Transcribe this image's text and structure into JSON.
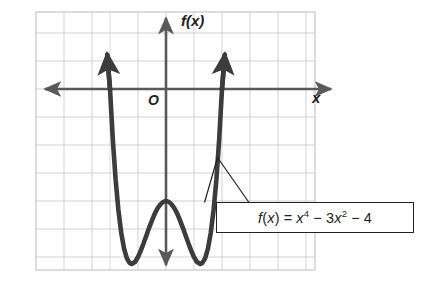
{
  "figure": {
    "axis_label_x": "x",
    "axis_label_y": "f(x)",
    "origin_label": "O",
    "equation_label": "f(x) = x4 − 3x2 − 4",
    "colors": {
      "curve": "#3c3c3c",
      "axis": "#595959",
      "grid": "#c9c9d6",
      "plot_border": "#bfbfcc",
      "text": "#231f20",
      "callout_border": "#231f20",
      "background": "#ffffff"
    }
  },
  "chart_data": {
    "type": "line",
    "title": "",
    "subtitle": "",
    "xlabel": "x",
    "ylabel": "f(x)",
    "equation": "f(x) = x^4 - 3x^2 - 4",
    "equation_display": "f(x) = x⁴ − 3x² − 4",
    "grid": true,
    "legend": "none",
    "annotations": [
      {
        "text": "f(x) = x⁴ − 3x² − 4",
        "points_to_curve": true,
        "leader_lines": 2
      }
    ],
    "origin_label": "O",
    "xlim": [
      -4.64,
      5.32
    ],
    "ylim": [
      -6.46,
      2.75
    ],
    "x_unit_px": 28,
    "y_unit_px": 28,
    "axis_arrows": {
      "x_positive": true,
      "x_negative": true,
      "y_positive": true,
      "y_negative": true
    },
    "curve_arrows": {
      "left_end": true,
      "right_end": true
    },
    "key_points": {
      "local_maximum": {
        "x": 0,
        "y": -4
      },
      "local_minima": [
        {
          "x": -1.2247,
          "y": -6.25
        },
        {
          "x": 1.2247,
          "y": -6.25
        }
      ],
      "x_intercepts": [
        {
          "x": -2,
          "y": 0
        },
        {
          "x": 2,
          "y": 0
        }
      ],
      "y_intercept": {
        "x": 0,
        "y": -4
      }
    },
    "x": [
      -2.1,
      -2.0,
      -1.9,
      -1.8,
      -1.7,
      -1.6,
      -1.5,
      -1.4,
      -1.3,
      -1.2247,
      -1.1,
      -1.0,
      -0.9,
      -0.8,
      -0.7,
      -0.6,
      -0.5,
      -0.4,
      -0.3,
      -0.2,
      -0.1,
      0.0,
      0.1,
      0.2,
      0.3,
      0.4,
      0.5,
      0.6,
      0.7,
      0.8,
      0.9,
      1.0,
      1.1,
      1.2247,
      1.3,
      1.4,
      1.5,
      1.6,
      1.7,
      1.8,
      1.9,
      2.0,
      2.1
    ],
    "values": [
      1.22,
      0.0,
      -1.79,
      -3.23,
      -4.32,
      -5.13,
      -5.69,
      -6.04,
      -6.21,
      -6.25,
      -6.17,
      -6.0,
      -5.77,
      -5.51,
      -5.23,
      -4.95,
      -4.69,
      -4.45,
      -4.26,
      -4.12,
      -4.03,
      -4.0,
      -4.03,
      -4.12,
      -4.26,
      -4.45,
      -4.69,
      -4.95,
      -5.23,
      -5.51,
      -5.77,
      -6.0,
      -6.17,
      -6.25,
      -6.21,
      -6.04,
      -5.69,
      -5.13,
      -4.32,
      -3.23,
      -1.79,
      0.0,
      1.22
    ],
    "series": [
      {
        "name": "f(x) = x^4 - 3x^2 - 4",
        "values": [
          1.22,
          0.0,
          -1.79,
          -3.23,
          -4.32,
          -5.13,
          -5.69,
          -6.04,
          -6.21,
          -6.25,
          -6.17,
          -6.0,
          -5.77,
          -5.51,
          -5.23,
          -4.95,
          -4.69,
          -4.45,
          -4.26,
          -4.12,
          -4.03,
          -4.0,
          -4.03,
          -4.12,
          -4.26,
          -4.45,
          -4.69,
          -4.95,
          -5.23,
          -5.51,
          -5.77,
          -6.0,
          -6.17,
          -6.25,
          -6.21,
          -6.04,
          -5.69,
          -5.13,
          -4.32,
          -3.23,
          -1.79,
          0.0,
          1.22
        ]
      }
    ]
  }
}
